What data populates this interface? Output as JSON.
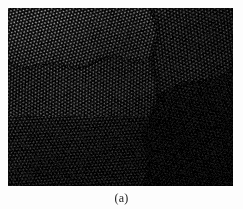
{
  "figure": {
    "caption": "(a)",
    "background_color": "#fdfdfd",
    "panel": {
      "name": "atomic-resolution-lattice-micrograph",
      "modality": "high-resolution electron micrograph",
      "x": 8,
      "y": 8,
      "width": 225,
      "height": 178,
      "base_color": "#0a0a0a",
      "description": "Dark grayscale atomic-resolution lattice image showing a dense periodic dot array broken into several misoriented grains separated by boundaries.",
      "lattice": {
        "period_px": 3.05,
        "dot_radius_px": 0.95,
        "pattern": "hexagonal-dot-array"
      },
      "grains": [
        {
          "id": "grain-upper-left",
          "label": "upper left grain",
          "orientation_deg": 14,
          "period_px": 3.0,
          "brightness": 1.0,
          "contrast": 1.0
        },
        {
          "id": "grain-upper-right",
          "label": "upper right grain",
          "orientation_deg": -7,
          "period_px": 3.1,
          "brightness": 0.78,
          "contrast": 0.92
        },
        {
          "id": "grain-middle-left",
          "label": "middle left grain",
          "orientation_deg": 2,
          "period_px": 3.0,
          "brightness": 0.9,
          "contrast": 0.98
        },
        {
          "id": "grain-lower-center",
          "label": "lower centre grain",
          "orientation_deg": 26,
          "period_px": 3.0,
          "brightness": 0.72,
          "contrast": 0.9
        },
        {
          "id": "grain-lower-right",
          "label": "lower right grain",
          "orientation_deg": 41,
          "period_px": 3.15,
          "brightness": 0.5,
          "contrast": 0.78
        }
      ],
      "boundaries": [
        {
          "id": "boundary-horizontal-upper-left",
          "type": "horizontal",
          "y_px": 54
        },
        {
          "id": "boundary-vertical-center",
          "type": "vertical",
          "x_px": 142
        },
        {
          "id": "boundary-diagonal-right",
          "type": "diagonal",
          "from": [
            150,
            86
          ],
          "to": [
            225,
            62
          ]
        }
      ],
      "illumination": {
        "brightest_corner": "top-left",
        "darkest_corner": "bottom-right",
        "vignette_strength": 0.55
      }
    }
  }
}
